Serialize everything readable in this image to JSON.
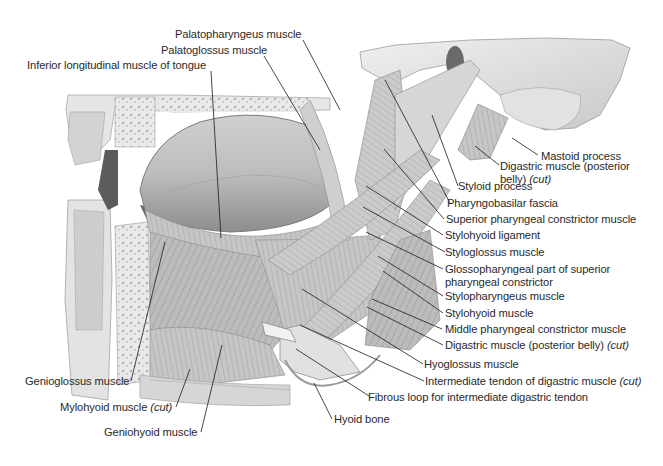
{
  "figure": {
    "type": "anatomical illustration",
    "palette": {
      "background": "#ffffff",
      "tissue_light": "#d9d9d9",
      "tissue_mid": "#b3b3b3",
      "tissue_dark": "#6e6e6e",
      "bone": "#e6e6e6",
      "label_text": "#2a2a2a",
      "leader_line": "#1a1a1a"
    }
  },
  "labels": {
    "top": [
      {
        "id": "palatopharyngeus",
        "text": "Palatopharyngeus muscle"
      },
      {
        "id": "palatoglossus",
        "text": "Palatoglossus muscle"
      },
      {
        "id": "inferior_longitudinal",
        "text": "Inferior longitudinal muscle of tongue"
      }
    ],
    "right": [
      {
        "id": "mastoid",
        "text": "Mastoid process"
      },
      {
        "id": "digastric_post_1",
        "text": "Digastric muscle (posterior",
        "text2": "belly)",
        "cut": "(cut)"
      },
      {
        "id": "styloid",
        "text": "Styloid process"
      },
      {
        "id": "pharyngobasilar",
        "text": "Pharyngobasilar fascia"
      },
      {
        "id": "sup_constrictor",
        "text": "Superior pharyngeal constrictor muscle"
      },
      {
        "id": "stylohyoid_lig",
        "text": "Stylohyoid ligament"
      },
      {
        "id": "styloglossus",
        "text": "Styloglossus muscle"
      },
      {
        "id": "glossopharyngeal",
        "text": "Glossopharyngeal part of superior",
        "text2": "pharyngeal constrictor"
      },
      {
        "id": "stylopharyngeus",
        "text": "Stylopharyngeus muscle"
      },
      {
        "id": "stylohyoid",
        "text": "Stylohyoid muscle"
      },
      {
        "id": "mid_constrictor",
        "text": "Middle pharyngeal constrictor muscle"
      },
      {
        "id": "digastric_post_2",
        "text": "Digastric muscle (posterior belly)",
        "cut": "(cut)"
      }
    ],
    "bottom": [
      {
        "id": "hyoglossus",
        "text": "Hyoglossus muscle"
      },
      {
        "id": "intermediate_tendon",
        "text": "Intermediate tendon of digastric muscle",
        "cut": "(cut)"
      },
      {
        "id": "fibrous_loop",
        "text": "Fibrous loop for intermediate digastric tendon"
      },
      {
        "id": "hyoid",
        "text": "Hyoid bone"
      }
    ],
    "left": [
      {
        "id": "genioglossus",
        "text": "Genioglossus muscle"
      },
      {
        "id": "mylohyoid",
        "text": "Mylohyoid muscle",
        "cut": "(cut)"
      },
      {
        "id": "geniohyoid",
        "text": "Geniohyoid muscle"
      }
    ]
  }
}
